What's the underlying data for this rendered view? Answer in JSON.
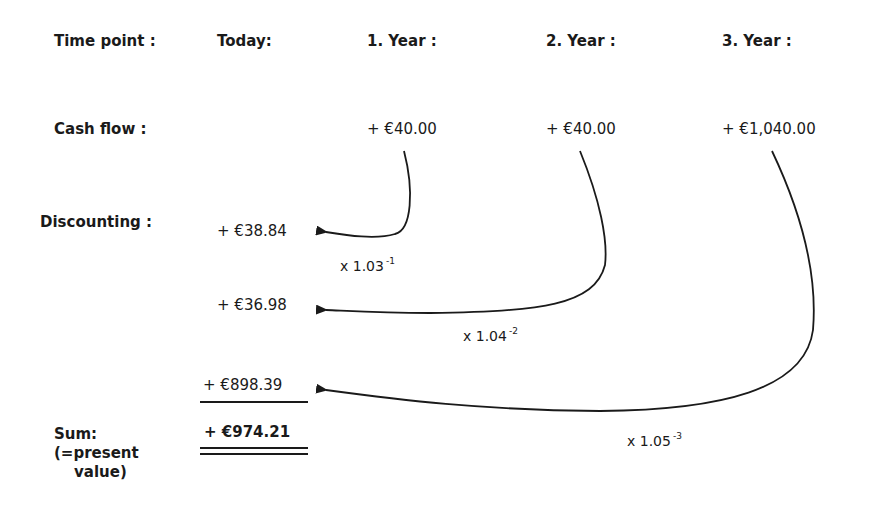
{
  "header": {
    "time_point_label": "Time point :",
    "columns": [
      "Today:",
      "1. Year :",
      "2. Year :",
      "3. Year :"
    ]
  },
  "cash_flow": {
    "label": "Cash flow :",
    "values": [
      "+ €40.00",
      "+ €40.00",
      "+ €1,040.00"
    ]
  },
  "discounting": {
    "label": "Discounting :",
    "values": [
      "+ €38.84",
      "+ €36.98",
      "+ €898.39"
    ],
    "factors": [
      {
        "base": "x 1.03",
        "exp": "-1"
      },
      {
        "base": "x 1.04",
        "exp": "-2"
      },
      {
        "base": "x 1.05",
        "exp": "-3"
      }
    ]
  },
  "sum": {
    "label_line1": "Sum:",
    "label_line2": "(=present",
    "label_line3": "value)",
    "value": "+ €974.21"
  },
  "colors": {
    "ink": "#1a1a1a",
    "background": "#ffffff"
  }
}
